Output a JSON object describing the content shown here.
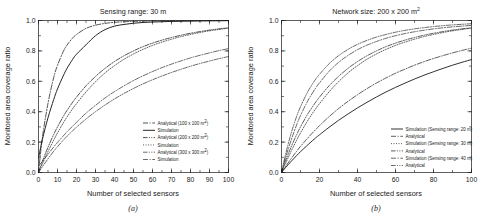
{
  "figure": {
    "panels": [
      {
        "id": "a",
        "caption": "(a)",
        "title": "Sensing range: 30 m",
        "xlabel": "Number of selected sensors",
        "ylabel": "Monitored area coverage ratio"
      },
      {
        "id": "b",
        "caption": "(b)",
        "title_prefix": "Network size: 200 x 200 m",
        "title_sup": "2",
        "xlabel": "Number of selected sensors",
        "ylabel": "Monitored area coverage ratio"
      }
    ]
  },
  "chart_data": [
    {
      "type": "line",
      "panel": "a",
      "title": "Sensing range: 30 m",
      "xlabel": "Number of selected sensors",
      "ylabel": "Monitored area coverage ratio",
      "xlim": [
        0,
        100
      ],
      "ylim": [
        0,
        1
      ],
      "xticks": [
        0,
        10,
        20,
        30,
        40,
        50,
        60,
        70,
        80,
        90,
        100
      ],
      "yticks": [
        "0.0",
        "0.2",
        "0.4",
        "0.6",
        "0.8",
        "1.0"
      ],
      "grid": false,
      "legend_position": "lower-right",
      "x": [
        0,
        2,
        5,
        8,
        10,
        13,
        15,
        18,
        20,
        25,
        30,
        35,
        40,
        45,
        50,
        55,
        60,
        65,
        70,
        75,
        80,
        85,
        90,
        95,
        100
      ],
      "series": [
        {
          "name": "Analytical (100 x 100 m2)",
          "label_prefix": "Analytical (100 x 100 m",
          "label_sup": "2",
          "label_suffix": ")",
          "style": "dashdot",
          "width": 0.75,
          "values": [
            0.0,
            0.225,
            0.455,
            0.625,
            0.705,
            0.795,
            0.838,
            0.885,
            0.908,
            0.948,
            0.969,
            0.981,
            0.988,
            0.992,
            0.994,
            0.996,
            0.997,
            0.998,
            0.998,
            0.999,
            0.999,
            0.999,
            0.999,
            1.0,
            1.0
          ]
        },
        {
          "name": "Simulation (100 x 100 m2)",
          "label_prefix": "Simulation",
          "label_sup": "",
          "label_suffix": "",
          "style": "solid",
          "width": 0.95,
          "values": [
            0.095,
            0.215,
            0.36,
            0.48,
            0.55,
            0.635,
            0.685,
            0.745,
            0.778,
            0.84,
            0.9,
            0.94,
            0.963,
            0.974,
            0.982,
            0.987,
            0.99,
            0.992,
            0.994,
            0.995,
            0.996,
            0.997,
            0.998,
            0.998,
            0.999
          ]
        },
        {
          "name": "Analytical (200 x 200 m2)",
          "label_prefix": "Analytical (200 x 200 m",
          "label_sup": "2",
          "label_suffix": ")",
          "style": "dashdotdot",
          "width": 0.75,
          "values": [
            0.0,
            0.072,
            0.166,
            0.25,
            0.3,
            0.368,
            0.408,
            0.463,
            0.496,
            0.57,
            0.632,
            0.685,
            0.73,
            0.768,
            0.8,
            0.828,
            0.851,
            0.871,
            0.888,
            0.903,
            0.916,
            0.927,
            0.937,
            0.945,
            0.952
          ]
        },
        {
          "name": "Simulation (200 x 200 m2)",
          "label_prefix": "Simulation",
          "label_sup": "",
          "label_suffix": "",
          "style": "dotted",
          "width": 0.7,
          "values": [
            0.0,
            0.055,
            0.138,
            0.213,
            0.26,
            0.325,
            0.365,
            0.42,
            0.453,
            0.53,
            0.597,
            0.655,
            0.703,
            0.745,
            0.78,
            0.81,
            0.836,
            0.858,
            0.877,
            0.894,
            0.908,
            0.921,
            0.932,
            0.941,
            0.95
          ]
        },
        {
          "name": "Analytical (300 x 300 m2)",
          "label_prefix": "Analytical (300 x 300 m",
          "label_sup": "2",
          "label_suffix": ")",
          "style": "dashdotdot",
          "width": 0.65,
          "values": [
            0.0,
            0.037,
            0.09,
            0.14,
            0.17,
            0.212,
            0.238,
            0.275,
            0.298,
            0.352,
            0.4,
            0.444,
            0.484,
            0.52,
            0.553,
            0.583,
            0.61,
            0.635,
            0.658,
            0.679,
            0.699,
            0.717,
            0.733,
            0.749,
            0.763
          ]
        },
        {
          "name": "Simulation (300 x 300 m2)",
          "label_prefix": "Simulation",
          "label_sup": "",
          "label_suffix": "",
          "style": "dashdot",
          "width": 0.65,
          "values": [
            0.045,
            0.072,
            0.12,
            0.168,
            0.198,
            0.24,
            0.268,
            0.305,
            0.33,
            0.39,
            0.442,
            0.49,
            0.532,
            0.57,
            0.605,
            0.636,
            0.664,
            0.69,
            0.713,
            0.734,
            0.754,
            0.771,
            0.787,
            0.802,
            0.815
          ]
        }
      ]
    },
    {
      "type": "line",
      "panel": "b",
      "title": "Network size: 200 x 200 m2",
      "xlabel": "Number of selected sensors",
      "ylabel": "Monitored area coverage ratio",
      "xlim": [
        0,
        100
      ],
      "ylim": [
        0,
        1
      ],
      "xticks": [
        0,
        20,
        40,
        60,
        80,
        100
      ],
      "yticks": [
        "0.0",
        "0.2",
        "0.4",
        "0.6",
        "0.8",
        "1.0"
      ],
      "grid": false,
      "legend_position": "lower-right",
      "x": [
        0,
        2,
        5,
        8,
        10,
        13,
        15,
        18,
        20,
        25,
        30,
        35,
        40,
        45,
        50,
        55,
        60,
        65,
        70,
        75,
        80,
        85,
        90,
        95,
        100
      ],
      "series": [
        {
          "name": "Simulation (Sensing range: 20 m)",
          "label": "Simulation (Sensing range: 20 m)",
          "style": "solid",
          "width": 0.9,
          "values": [
            0.0,
            0.03,
            0.072,
            0.112,
            0.137,
            0.172,
            0.195,
            0.228,
            0.248,
            0.297,
            0.343,
            0.385,
            0.425,
            0.462,
            0.497,
            0.53,
            0.56,
            0.588,
            0.615,
            0.64,
            0.663,
            0.685,
            0.706,
            0.725,
            0.743
          ]
        },
        {
          "name": "Analytical (Sensing range: 20 m)",
          "label": "Analytical",
          "style": "dashdot",
          "width": 0.7,
          "values": [
            0.0,
            0.037,
            0.09,
            0.14,
            0.172,
            0.215,
            0.243,
            0.283,
            0.308,
            0.367,
            0.42,
            0.468,
            0.512,
            0.552,
            0.589,
            0.622,
            0.653,
            0.68,
            0.706,
            0.729,
            0.75,
            0.769,
            0.787,
            0.803,
            0.818
          ]
        },
        {
          "name": "Simulation (Sensing range: 30 m)",
          "label": "Simulation (Sensing range: 30 m)",
          "style": "dotted",
          "width": 0.7,
          "values": [
            0.0,
            0.055,
            0.138,
            0.213,
            0.26,
            0.325,
            0.365,
            0.42,
            0.453,
            0.53,
            0.597,
            0.655,
            0.703,
            0.745,
            0.78,
            0.81,
            0.836,
            0.858,
            0.877,
            0.894,
            0.908,
            0.921,
            0.932,
            0.941,
            0.95
          ]
        },
        {
          "name": "Analytical (Sensing range: 30 m)",
          "label": "Analytical",
          "style": "dashdotdot",
          "width": 0.7,
          "values": [
            0.0,
            0.072,
            0.166,
            0.25,
            0.3,
            0.368,
            0.408,
            0.463,
            0.496,
            0.57,
            0.632,
            0.685,
            0.73,
            0.768,
            0.8,
            0.828,
            0.851,
            0.871,
            0.888,
            0.903,
            0.916,
            0.927,
            0.937,
            0.945,
            0.952
          ]
        },
        {
          "name": "Simulation (Sensing range: 40 m)",
          "label": "Simulation (Sensing range: 40 m)",
          "style": "dashdot",
          "width": 0.65,
          "values": [
            0.0,
            0.09,
            0.21,
            0.315,
            0.375,
            0.452,
            0.497,
            0.556,
            0.59,
            0.665,
            0.724,
            0.77,
            0.808,
            0.838,
            0.862,
            0.883,
            0.9,
            0.914,
            0.926,
            0.936,
            0.945,
            0.952,
            0.958,
            0.963,
            0.968
          ]
        },
        {
          "name": "Analytical (Sensing range: 40 m)",
          "label": "Analytical",
          "style": "dashdotdot",
          "width": 0.65,
          "values": [
            0.0,
            0.112,
            0.255,
            0.37,
            0.432,
            0.512,
            0.557,
            0.614,
            0.646,
            0.715,
            0.768,
            0.81,
            0.843,
            0.869,
            0.891,
            0.908,
            0.923,
            0.935,
            0.945,
            0.953,
            0.96,
            0.966,
            0.971,
            0.975,
            0.979
          ]
        }
      ]
    }
  ]
}
